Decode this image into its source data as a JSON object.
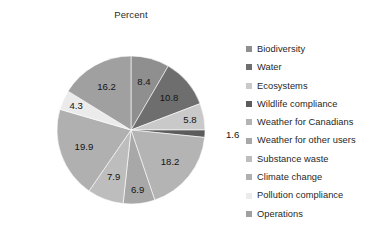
{
  "chart_data": {
    "type": "pie",
    "title": "Percent",
    "xlabel": "",
    "ylabel": "",
    "legend_position": "right",
    "grid": false,
    "start_angle_deg": 0,
    "direction": "clockwise",
    "categories": [
      "Biodiversity",
      "Water",
      "Ecosystems",
      "Wildlife compliance",
      "Weather for Canadians",
      "Weather for other users",
      "Substance waste",
      "Climate change",
      "Pollution compliance",
      "Operations"
    ],
    "values": [
      8.4,
      10.8,
      5.8,
      1.6,
      18.2,
      6.9,
      7.9,
      19.9,
      4.3,
      16.2
    ],
    "labels": [
      "8.4",
      "10.8",
      "5.8",
      "1.6",
      "18.2",
      "6.9",
      "7.9",
      "19.9",
      "4.3",
      "16.2"
    ],
    "colors": [
      "#8f8f8f",
      "#6e6e6e",
      "#c9c9c9",
      "#5c5c5c",
      "#b4b4b4",
      "#a8a8a8",
      "#bdbdbd",
      "#b0b0b0",
      "#ebebeb",
      "#a0a0a0"
    ]
  },
  "legend": {
    "items": [
      {
        "label": "Biodiversity",
        "color": "#8f8f8f"
      },
      {
        "label": "Water",
        "color": "#6e6e6e"
      },
      {
        "label": "Ecosystems",
        "color": "#c9c9c9"
      },
      {
        "label": "Wildlife compliance",
        "color": "#5c5c5c"
      },
      {
        "label": "Weather for Canadians",
        "color": "#b4b4b4"
      },
      {
        "label": "Weather for other users",
        "color": "#a8a8a8"
      },
      {
        "label": "Substance waste",
        "color": "#bdbdbd"
      },
      {
        "label": "Climate change",
        "color": "#b0b0b0"
      },
      {
        "label": "Pollution compliance",
        "color": "#ebebeb"
      },
      {
        "label": "Operations",
        "color": "#a0a0a0"
      }
    ]
  }
}
